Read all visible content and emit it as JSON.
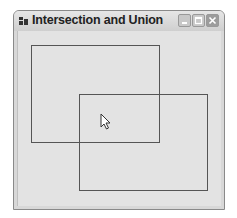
{
  "window": {
    "title": "Intersection and Union",
    "icon": "app-window-icon",
    "controls": [
      "minimize",
      "maximize",
      "close"
    ]
  },
  "canvas": {
    "rectangles": [
      {
        "name": "rectangle-1",
        "left": 31,
        "top": 45,
        "right": 159,
        "bottom": 142,
        "stroke": "#555555"
      },
      {
        "name": "rectangle-2",
        "left": 79,
        "top": 94,
        "right": 207,
        "bottom": 190,
        "stroke": "#555555"
      }
    ],
    "background": "#e3e3e3"
  },
  "cursor": {
    "icon": "arrow-cursor-icon",
    "x": 100,
    "y": 113
  }
}
